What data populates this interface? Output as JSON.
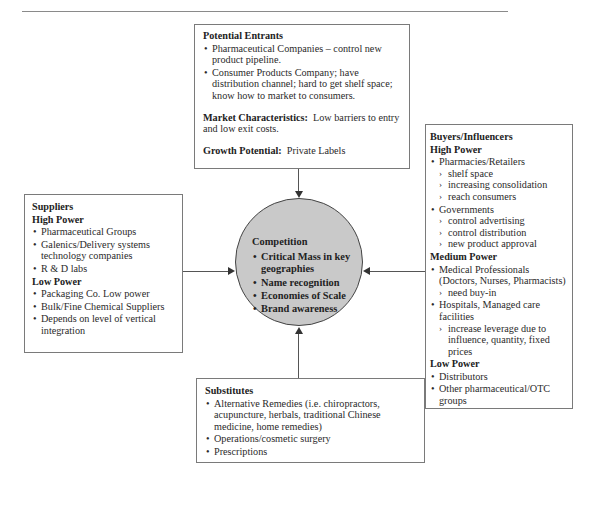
{
  "diagram": {
    "type": "five-forces",
    "potential_entrants": {
      "title": "Potential Entrants",
      "bullets": [
        "Pharmaceutical Companies – control new product pipeline.",
        "Consumer Products Company; have distribution channel; hard to get shelf space; know how to market to consumers."
      ],
      "market_label": "Market Characteristics:",
      "market_text": "Low barriers to entry and low exit costs.",
      "growth_label": "Growth Potential:",
      "growth_text": "Private Labels"
    },
    "suppliers": {
      "title": "Suppliers",
      "high_label": "High Power",
      "high_items": [
        "Pharmaceutical Groups",
        "Galenics/Delivery systems technology companies",
        "R & D labs"
      ],
      "low_label": "Low Power",
      "low_items": [
        "Packaging Co. Low power",
        "Bulk/Fine Chemical Suppliers",
        "Depends on level of vertical integration"
      ]
    },
    "competition": {
      "title": "Competition",
      "items": [
        "Critical Mass in key geographies",
        "Name recognition",
        "Economies of Scale",
        "Brand awareness"
      ]
    },
    "buyers": {
      "title": "Buyers/Influencers",
      "high_label": "High Power",
      "pharmacies": "Pharmacies/Retailers",
      "pharmacies_sub": [
        "shelf space",
        "increasing consolidation",
        "reach consumers"
      ],
      "governments": "Governments",
      "governments_sub": [
        "control advertising",
        "control distribution",
        "new product approval"
      ],
      "medium_label": "Medium Power",
      "medical": "Medical Professionals (Doctors, Nurses, Pharmacists)",
      "medical_sub": [
        "need buy-in"
      ],
      "hospitals": "Hospitals, Managed care facilities",
      "hospitals_sub": [
        "increase leverage due to influence, quantity, fixed prices"
      ],
      "low_label": "Low Power",
      "low_items": [
        "Distributors",
        "Other pharmaceutical/OTC groups"
      ]
    },
    "substitutes": {
      "title": "Substitutes",
      "items": [
        "Alternative Remedies (i.e. chiropractors, acupuncture, herbals, traditional Chinese medicine, home remedies)",
        "Operations/cosmetic surgery",
        "Prescriptions"
      ]
    },
    "colors": {
      "circle_fill": "#c9c9c9",
      "border": "#7a7a7a",
      "text": "#2a2a2a"
    }
  }
}
